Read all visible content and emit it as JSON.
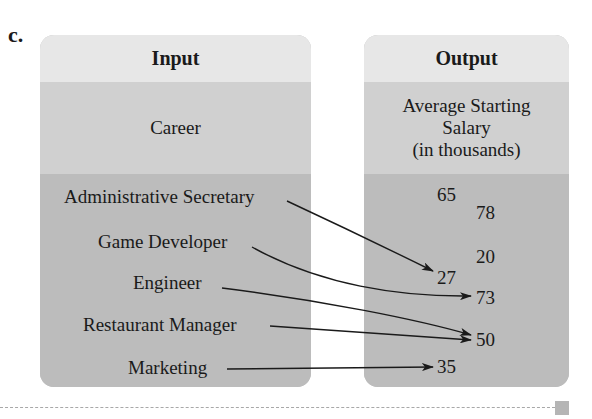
{
  "part_label": "c.",
  "input": {
    "header": "Input",
    "category": "Career",
    "items": [
      "Administrative Secretary",
      "Game Developer",
      "Engineer",
      "Restaurant Manager",
      "Marketing"
    ]
  },
  "output": {
    "header": "Output",
    "category_lines": [
      "Average Starting",
      "Salary",
      "(in thousands)"
    ],
    "values": [
      "65",
      "78",
      "20",
      "27",
      "73",
      "50",
      "35"
    ]
  },
  "mappings": [
    {
      "from": "Administrative Secretary",
      "to": "27"
    },
    {
      "from": "Game Developer",
      "to": "73"
    },
    {
      "from": "Engineer",
      "to": "50"
    },
    {
      "from": "Restaurant Manager",
      "to": "50"
    },
    {
      "from": "Marketing",
      "to": "35"
    }
  ],
  "colors": {
    "header_bg": "#e7e7e7",
    "category_bg": "#d0d0d0",
    "body_bg": "#bcbcbc",
    "arrow": "#1a1a1a"
  }
}
